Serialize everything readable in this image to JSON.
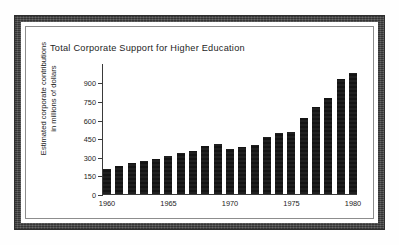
{
  "chart_data": {
    "type": "bar",
    "title": "Total Corporate Support for Higher Education",
    "xlabel": "",
    "ylabel": "Estimated corporate contributions in millions of dollars",
    "ylabel_line1": "Estimated corporate contributions",
    "ylabel_line2": "in millions of dollars",
    "categories": [
      1960,
      1961,
      1962,
      1963,
      1964,
      1965,
      1966,
      1967,
      1968,
      1969,
      1970,
      1971,
      1972,
      1973,
      1974,
      1975,
      1976,
      1977,
      1978,
      1979,
      1980
    ],
    "values": [
      205,
      228,
      250,
      268,
      285,
      305,
      330,
      348,
      385,
      400,
      365,
      378,
      395,
      462,
      490,
      500,
      610,
      700,
      778,
      930,
      975
    ],
    "ylim": [
      0,
      1000
    ],
    "yticks": [
      0,
      150,
      300,
      450,
      600,
      750,
      900
    ],
    "ytick_labels": [
      "0",
      "150",
      "300",
      "450",
      "600",
      "750",
      "900"
    ],
    "xticks": [
      1960,
      1965,
      1970,
      1975,
      1980
    ],
    "xtick_labels": [
      "1960",
      "1965",
      "1970",
      "1975",
      "1980"
    ],
    "grid": false,
    "legend": null,
    "bar_color": "#141414",
    "axis_color": "#3a3a3a",
    "text_color": "#1d1d1d"
  },
  "frame": {
    "border_color": "#4a4a4a",
    "inner_line_color": "#8d8d8d",
    "background": "#ffffff"
  }
}
